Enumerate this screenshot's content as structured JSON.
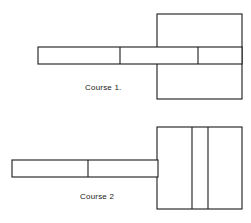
{
  "page": {
    "background_color": "#ffffff",
    "line_color": "#1a1a1a",
    "width": 251,
    "height": 223
  },
  "figures": [
    {
      "id": "course-1",
      "label": "Course 1.",
      "label_position": {
        "x": 85,
        "y": 83
      },
      "shapes": {
        "block": {
          "x": 157,
          "y": 14,
          "width": 85,
          "height": 85
        },
        "bar": {
          "x": 38,
          "y": 47,
          "width": 204,
          "height": 17
        },
        "bar_dividers_x": [
          120,
          198
        ]
      }
    },
    {
      "id": "course-2",
      "label": "Course 2",
      "label_position": {
        "x": 80,
        "y": 192
      },
      "shapes": {
        "block": {
          "x": 157,
          "y": 127,
          "width": 85,
          "height": 82
        },
        "block_dividers_x": [
          192,
          208
        ],
        "bar": {
          "x": 12,
          "y": 160,
          "width": 146,
          "height": 17
        },
        "bar_dividers_x": [
          88
        ]
      }
    }
  ]
}
